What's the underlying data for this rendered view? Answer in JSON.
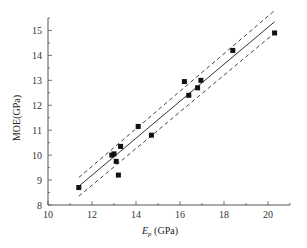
{
  "chart_data": {
    "type": "scatter",
    "title": "",
    "xlabel": "E_p (GPa)",
    "xlabel_main": "E",
    "xlabel_sub": "p",
    "xlabel_unit": " (GPa)",
    "ylabel": "MOE(GPa)",
    "xlim": [
      10,
      21
    ],
    "ylim": [
      8,
      15.5
    ],
    "x_ticks": [
      10,
      12,
      14,
      16,
      18,
      20
    ],
    "y_ticks": [
      8,
      9,
      10,
      11,
      12,
      13,
      14,
      15
    ],
    "grid": false,
    "legend": null,
    "series": [
      {
        "name": "data",
        "marker": "square",
        "color": "#111111",
        "points": [
          [
            11.4,
            8.7
          ],
          [
            12.9,
            10.0
          ],
          [
            13.0,
            10.05
          ],
          [
            13.1,
            9.75
          ],
          [
            13.2,
            9.2
          ],
          [
            13.3,
            10.35
          ],
          [
            14.1,
            11.15
          ],
          [
            14.7,
            10.8
          ],
          [
            16.2,
            12.95
          ],
          [
            16.4,
            12.4
          ],
          [
            16.8,
            12.7
          ],
          [
            16.95,
            13.0
          ],
          [
            18.4,
            14.2
          ],
          [
            20.3,
            14.9
          ]
        ]
      },
      {
        "name": "fit",
        "style": "solid",
        "color": "#333333",
        "line": [
          [
            11.4,
            8.75
          ],
          [
            20.3,
            15.35
          ]
        ]
      },
      {
        "name": "upper-bound",
        "style": "dashed",
        "color": "#444444",
        "line": [
          [
            11.4,
            9.1
          ],
          [
            20.3,
            15.8
          ]
        ]
      },
      {
        "name": "lower-bound",
        "style": "dashed",
        "color": "#444444",
        "line": [
          [
            11.4,
            8.35
          ],
          [
            20.3,
            14.9
          ]
        ]
      }
    ]
  }
}
